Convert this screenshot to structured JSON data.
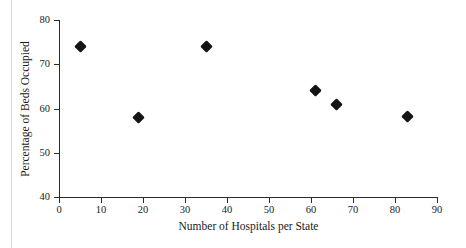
{
  "chart_data": {
    "type": "scatter",
    "title": "",
    "xlabel": "Number of Hospitals per State",
    "ylabel": "Percentage of Beds Occupied",
    "xlim": [
      0,
      90
    ],
    "ylim": [
      40,
      80
    ],
    "xticks": [
      0,
      10,
      20,
      30,
      40,
      50,
      60,
      70,
      80,
      90
    ],
    "xtick_labels": [
      "0",
      "10",
      "20",
      "30",
      "40",
      "50",
      "60",
      "70",
      "80",
      "90"
    ],
    "yticks": [
      40,
      50,
      60,
      70,
      80
    ],
    "ytick_labels": [
      "40",
      "50",
      "60",
      "70",
      "80"
    ],
    "grid": false,
    "legend": null,
    "marker": "diamond",
    "marker_color": "#141414",
    "axis_color": "#2b2b2b",
    "background": "#ffffff",
    "series": [
      {
        "name": "Hospitals vs Beds Occupied",
        "points": [
          {
            "x": 5,
            "y": 74.0
          },
          {
            "x": 19,
            "y": 58.0
          },
          {
            "x": 35,
            "y": 74.0
          },
          {
            "x": 61,
            "y": 64.0
          },
          {
            "x": 66,
            "y": 61.0
          },
          {
            "x": 83,
            "y": 58.2
          }
        ]
      }
    ]
  }
}
